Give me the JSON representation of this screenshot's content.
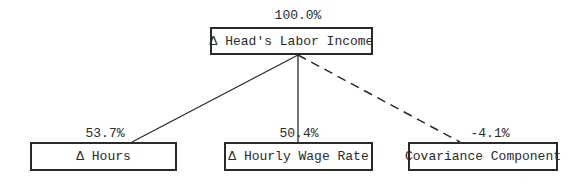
{
  "diagram": {
    "root": {
      "label": "Δ Head's Labor Income",
      "percent": "100.0%"
    },
    "children": [
      {
        "label": "Δ Hours",
        "percent": "53.7%",
        "edge": "solid"
      },
      {
        "label": "Δ Hourly Wage Rate",
        "percent": "50.4%",
        "edge": "solid"
      },
      {
        "label": "Covariance Component",
        "percent": "-4.1%",
        "edge": "dashed"
      }
    ]
  }
}
